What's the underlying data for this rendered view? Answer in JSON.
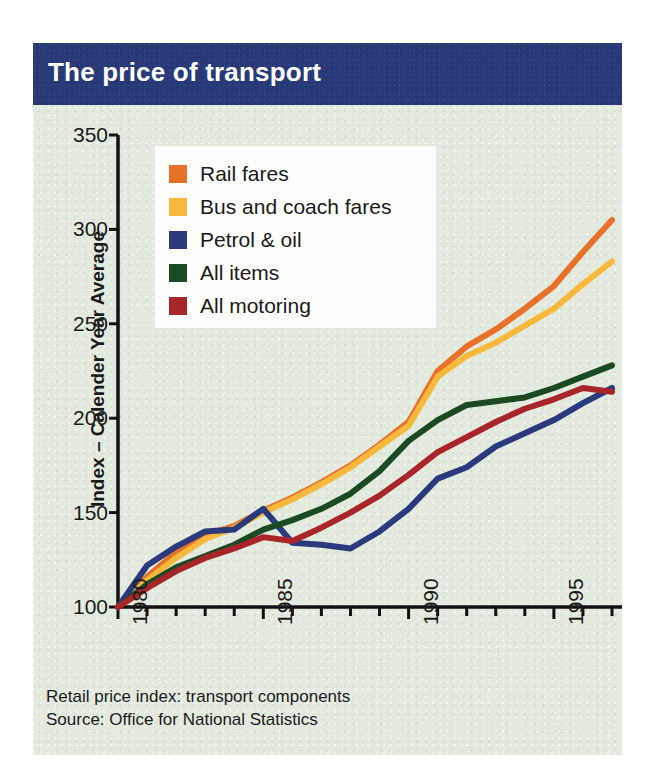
{
  "title": "The price of transport",
  "footnotes": [
    "Retail price index: transport components",
    "Source: Office for National Statistics"
  ],
  "colors": {
    "panel_background": "#e2eade",
    "title_bar": "#273a77",
    "title_text": "#ffffff",
    "axis": "#111111",
    "legend_background": "#fdfdfb",
    "rail_fares": "#e8712a",
    "bus_and_coach_fares": "#f7b83c",
    "petrol_and_oil": "#2a3a7c",
    "all_items": "#1a4a22",
    "all_motoring": "#a8252a"
  },
  "legend": {
    "position": "upper-left-inside",
    "items": [
      {
        "label": "Rail fares",
        "color": "#e8712a"
      },
      {
        "label": "Bus and coach fares",
        "color": "#f7b83c"
      },
      {
        "label": "Petrol & oil",
        "color": "#2a3a7c"
      },
      {
        "label": "All items",
        "color": "#1a4a22"
      },
      {
        "label": "All motoring",
        "color": "#a8252a"
      }
    ]
  },
  "chart_data": {
    "type": "line",
    "title": "The price of transport",
    "subtitle": "Retail price index: transport components",
    "source": "Source: Office for National Statistics",
    "xlabel": "",
    "ylabel": "Index – Calender Year Average",
    "xlim": [
      1980,
      1997
    ],
    "ylim": [
      100,
      350
    ],
    "yticks": [
      100,
      150,
      200,
      250,
      300,
      350
    ],
    "ytick_labels": [
      "100",
      "150",
      "200",
      "250",
      "300",
      "350"
    ],
    "xticks": [
      1980,
      1985,
      1990,
      1995
    ],
    "xtick_labels": [
      "1980",
      "1985",
      "1990",
      "1995"
    ],
    "xtick_rotation": -90,
    "minor_xticks_every": 1,
    "grid": false,
    "x": [
      1980,
      1981,
      1982,
      1983,
      1984,
      1985,
      1986,
      1987,
      1988,
      1989,
      1990,
      1991,
      1992,
      1993,
      1994,
      1995,
      1996,
      1997
    ],
    "series": [
      {
        "name": "Rail fares",
        "color": "#e8712a",
        "values": [
          100,
          116,
          129,
          138,
          143,
          151,
          158,
          166,
          175,
          186,
          198,
          225,
          238,
          247,
          258,
          270,
          288,
          305
        ]
      },
      {
        "name": "Bus and coach fares",
        "color": "#f7b83c",
        "values": [
          100,
          114,
          126,
          136,
          142,
          150,
          157,
          165,
          174,
          185,
          196,
          222,
          233,
          240,
          249,
          258,
          271,
          283
        ]
      },
      {
        "name": "Petrol & oil",
        "color": "#2a3a7c",
        "values": [
          100,
          122,
          132,
          140,
          141,
          152,
          134,
          133,
          131,
          140,
          152,
          168,
          174,
          185,
          192,
          199,
          208,
          216
        ]
      },
      {
        "name": "All items",
        "color": "#1a4a22",
        "values": [
          100,
          112,
          121,
          127,
          133,
          141,
          146,
          152,
          160,
          172,
          188,
          199,
          207,
          209,
          211,
          216,
          222,
          228
        ]
      },
      {
        "name": "All motoring",
        "color": "#a8252a",
        "values": [
          100,
          110,
          119,
          126,
          131,
          137,
          135,
          142,
          150,
          159,
          170,
          182,
          190,
          198,
          205,
          210,
          216,
          214
        ]
      }
    ]
  }
}
